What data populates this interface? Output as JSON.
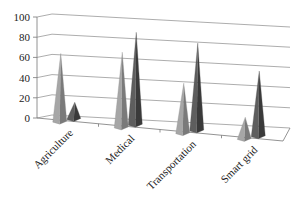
{
  "chart_data": {
    "type": "bar",
    "subtype": "3d-pyramid",
    "title": "",
    "xlabel": "",
    "ylabel": "",
    "categories": [
      "Agriculture",
      "Medical",
      "Transportation",
      "Smart grid"
    ],
    "series": [
      {
        "name": "Series 1",
        "color": "#8c8c8c",
        "values": [
          68,
          75,
          50,
          22
        ]
      },
      {
        "name": "Series 2",
        "color": "#4a4a4a",
        "values": [
          17,
          92,
          87,
          65
        ]
      }
    ],
    "ylim": [
      0,
      100
    ],
    "yticks": [
      0,
      20,
      40,
      60,
      80,
      100
    ],
    "ytick_labels": [
      "0",
      "20",
      "40",
      "60",
      "80",
      "100"
    ],
    "grid": true,
    "legend": "none"
  }
}
